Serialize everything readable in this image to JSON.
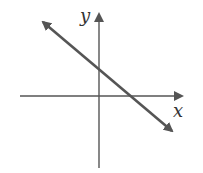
{
  "diagram": {
    "type": "coordinate-plane-line",
    "axes": {
      "x_label": "x",
      "y_label": "y",
      "color": "#555555"
    },
    "line": {
      "description": "straight line with negative slope, arrows at both ends",
      "slope_sign": "negative",
      "y_intercept_sign": "positive",
      "x_intercept_sign": "positive",
      "color": "#555555"
    }
  }
}
